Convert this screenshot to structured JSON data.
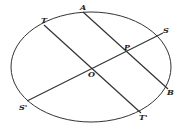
{
  "diagram": {
    "type": "ellipse-conjugate-diameters",
    "ellipse": {
      "cx": 91,
      "cy": 67,
      "rx": 80,
      "ry": 55
    },
    "colors": {
      "stroke": "#333333",
      "background": "#ffffff"
    },
    "points": {
      "A": {
        "label": "A",
        "x": 83,
        "y": 12
      },
      "T": {
        "label": "T",
        "x": 44,
        "y": 25
      },
      "S": {
        "label": "S",
        "x": 163,
        "y": 33
      },
      "P": {
        "label": "P",
        "x": 126,
        "y": 51
      },
      "O": {
        "label": "O",
        "x": 92,
        "y": 71
      },
      "B": {
        "label": "B",
        "x": 168,
        "y": 89
      },
      "S2": {
        "label": "S'",
        "x": 27,
        "y": 101
      },
      "T2": {
        "label": "T'",
        "x": 141,
        "y": 113
      }
    },
    "segments": [
      {
        "from": "T",
        "to": "T'"
      },
      {
        "from": "A",
        "to": "B"
      },
      {
        "from": "S'",
        "to": "S"
      }
    ]
  }
}
